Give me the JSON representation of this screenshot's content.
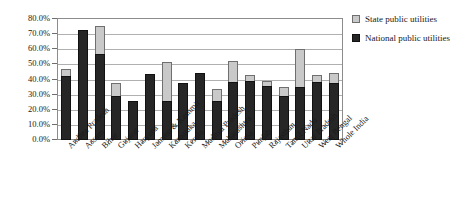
{
  "chart_data": {
    "type": "bar",
    "title": "",
    "subtitle": "",
    "xlabel": "",
    "ylabel": "",
    "ylim": [
      0,
      0.8
    ],
    "ytick_labels": [
      "0.0%",
      "10.0%",
      "20.0%",
      "30.0%",
      "40.0%",
      "50.0%",
      "60.0%",
      "70.0%",
      "80.0%"
    ],
    "ytick_values": [
      0,
      10,
      20,
      30,
      40,
      50,
      60,
      70,
      80
    ],
    "grid": true,
    "legend_position": "right",
    "stacked_overlay": true,
    "categories": [
      "Andhra Pradesh",
      "Assam",
      "Bihar",
      "Gujarat",
      "Haryana",
      "Jammu & Kashmir",
      "Karnataka",
      "Kerala",
      "Madhya Pradesh",
      "Maharashtra",
      "Orissa",
      "Punjab",
      "Rajasthan",
      "Tamil Nadu",
      "Uttar Pradesh",
      "West Bengal",
      "Whole India"
    ],
    "series": [
      {
        "name": "State public utilities",
        "color": "#c9c9c9",
        "values": [
          47.0,
          73.0,
          75.5,
          37.5,
          26.0,
          43.5,
          51.5,
          38.0,
          44.5,
          34.0,
          52.0,
          43.0,
          39.0,
          35.0,
          60.0,
          43.0,
          44.0
        ]
      },
      {
        "name": "National public utilities",
        "color": "#262626",
        "values": [
          42.0,
          73.0,
          57.0,
          29.0,
          26.0,
          43.5,
          26.0,
          38.0,
          44.5,
          26.0,
          38.5,
          39.0,
          36.0,
          29.0,
          35.0,
          38.5,
          38.0
        ]
      }
    ]
  },
  "legend": {
    "entries": [
      {
        "label": "State public utilities",
        "swatch": "state"
      },
      {
        "label": "National public utilities",
        "swatch": "national"
      }
    ]
  }
}
